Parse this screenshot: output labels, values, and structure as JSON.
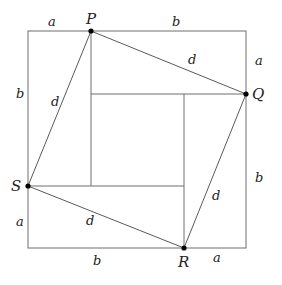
{
  "diagram": {
    "type": "geometric-proof",
    "points": {
      "P": "P",
      "Q": "Q",
      "R": "R",
      "S": "S"
    },
    "side_labels": {
      "top_left": "a",
      "top_right": "b",
      "right_top": "a",
      "right_bottom": "b",
      "bottom_right": "a",
      "bottom_left": "b",
      "left_bottom": "a",
      "left_top": "b"
    },
    "hypotenuse_labels": {
      "PQ": "d",
      "QR": "d",
      "RS": "d",
      "SP": "d"
    },
    "colors": {
      "line": "#6e6e6e",
      "text": "#222222",
      "point": "#000000"
    }
  }
}
